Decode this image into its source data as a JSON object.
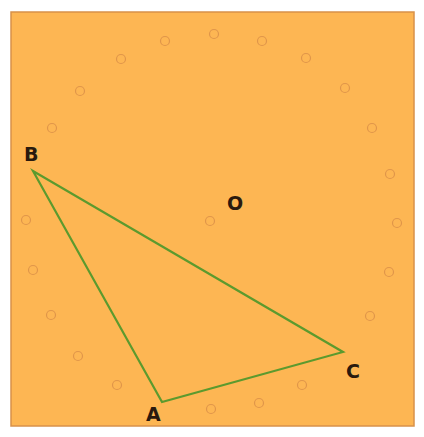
{
  "diagram": {
    "type": "geometry",
    "colors": {
      "page_background": "#ffffff",
      "board_fill": "#fdb653",
      "board_border": "#d8914a",
      "triangle_stroke": "#5c9a2e",
      "peg_stroke": "#e0964a",
      "label_color": "#2a1a0e"
    },
    "board": {
      "x": 11,
      "y": 12,
      "width": 403,
      "height": 414
    },
    "center": {
      "label": "O",
      "peg": {
        "x": 210,
        "y": 221
      },
      "label_pos": {
        "x": 227,
        "y": 210
      }
    },
    "triangle": {
      "vertices": [
        {
          "name": "A",
          "x": 162,
          "y": 402,
          "label_pos": {
            "x": 146,
            "y": 421
          }
        },
        {
          "name": "B",
          "x": 33,
          "y": 171,
          "label_pos": {
            "x": 24,
            "y": 161
          }
        },
        {
          "name": "C",
          "x": 343,
          "y": 352,
          "label_pos": {
            "x": 346,
            "y": 378
          }
        }
      ]
    },
    "pegs": [
      {
        "x": 214,
        "y": 34
      },
      {
        "x": 262,
        "y": 41
      },
      {
        "x": 306,
        "y": 58
      },
      {
        "x": 345,
        "y": 88
      },
      {
        "x": 372,
        "y": 128
      },
      {
        "x": 390,
        "y": 174
      },
      {
        "x": 397,
        "y": 223
      },
      {
        "x": 389,
        "y": 272
      },
      {
        "x": 370,
        "y": 316
      },
      {
        "x": 302,
        "y": 385
      },
      {
        "x": 259,
        "y": 403
      },
      {
        "x": 211,
        "y": 409
      },
      {
        "x": 117,
        "y": 385
      },
      {
        "x": 78,
        "y": 356
      },
      {
        "x": 51,
        "y": 315
      },
      {
        "x": 33,
        "y": 270
      },
      {
        "x": 26,
        "y": 220
      },
      {
        "x": 52,
        "y": 128
      },
      {
        "x": 80,
        "y": 91
      },
      {
        "x": 121,
        "y": 59
      },
      {
        "x": 165,
        "y": 41
      }
    ],
    "labels": {
      "A": "A",
      "B": "B",
      "C": "C",
      "O": "O"
    }
  }
}
